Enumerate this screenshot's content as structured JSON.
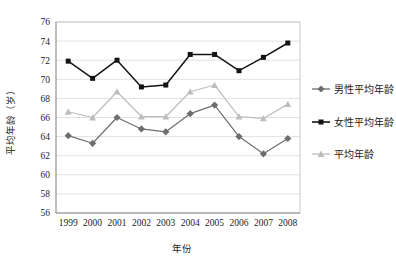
{
  "chart_data": {
    "type": "line",
    "title": "",
    "xlabel": "年份",
    "ylabel": "平均年龄（岁）",
    "categories": [
      "1999",
      "2000",
      "2001",
      "2002",
      "2003",
      "2004",
      "2005",
      "2006",
      "2007",
      "2008"
    ],
    "ylim": [
      56,
      76
    ],
    "yticks": [
      56,
      58,
      60,
      62,
      64,
      66,
      68,
      70,
      72,
      74,
      76
    ],
    "grid": true,
    "legend_position": "right",
    "series": [
      {
        "name": "男性平均年龄",
        "color": "#6e6e6e",
        "marker": "diamond",
        "values": [
          64.1,
          63.3,
          66.0,
          64.8,
          64.5,
          66.4,
          67.3,
          64.0,
          62.2,
          63.8
        ]
      },
      {
        "name": "女性平均年龄",
        "color": "#141414",
        "marker": "square",
        "values": [
          71.9,
          70.1,
          72.0,
          69.2,
          69.4,
          72.6,
          72.6,
          70.9,
          72.3,
          73.8
        ]
      },
      {
        "name": "平均年龄",
        "color": "#bdbdbd",
        "marker": "triangle",
        "values": [
          66.6,
          66.0,
          68.7,
          66.1,
          66.1,
          68.7,
          69.4,
          66.1,
          65.9,
          67.4
        ]
      }
    ]
  },
  "legend": {
    "items": [
      {
        "label": "男性平均年龄"
      },
      {
        "label": "女性平均年龄"
      },
      {
        "label": "平均年龄"
      }
    ]
  }
}
